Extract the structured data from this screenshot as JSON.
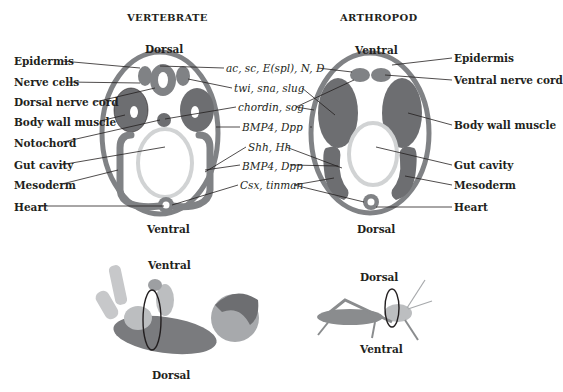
{
  "vertebrate": {
    "title": "VERTEBRATE",
    "top_label": "Dorsal",
    "bottom_label": "Ventral",
    "left_labels": [
      "Epidermis",
      "Nerve cells",
      "Dorsal nerve cord",
      "Body wall muscle",
      "Notochord",
      "Gut cavity",
      "Mesoderm",
      "Heart"
    ]
  },
  "arthropod": {
    "title": "ARTHROPOD",
    "top_label": "Ventral",
    "bottom_label": "Dorsal",
    "right_labels": [
      "Epidermis",
      "Ventral nerve cord",
      "Body wall muscle",
      "Gut cavity",
      "Mesoderm",
      "Heart"
    ]
  },
  "genes": [
    "ac, sc, E(spl), N, D",
    "twi, sna, slug",
    "chordin, sog",
    "BMP4, Dpp",
    "Shh, Hh",
    "BMP4, Dpp",
    "Csx, tinman"
  ],
  "baby": {
    "top_label": "Ventral",
    "bottom_label": "Dorsal",
    "icon": "human-infant-illustration"
  },
  "grasshopper": {
    "top_label": "Dorsal",
    "bottom_label": "Ventral",
    "icon": "grasshopper-illustration"
  },
  "colors": {
    "tissue_dark": "#6d6e71",
    "tissue_mid": "#808285",
    "gut_ring": "#d1d3d4",
    "line": "#231f20"
  }
}
